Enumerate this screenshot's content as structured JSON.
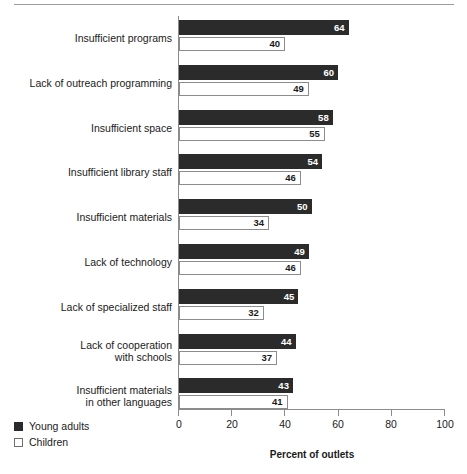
{
  "chart_data": {
    "type": "bar",
    "orientation": "horizontal",
    "title": "",
    "xlabel": "Percent of outlets",
    "ylabel": "",
    "xlim": [
      0,
      100
    ],
    "xticks": [
      0,
      20,
      40,
      60,
      80,
      100
    ],
    "xtick_labels": [
      "0",
      "20",
      "40",
      "60",
      "80",
      "100"
    ],
    "grid": false,
    "legend_position": "bottom-left",
    "categories": [
      "Insufficient programs",
      "Lack of outreach programming",
      "Insufficient space",
      "Insufficient library staff",
      "Insufficient materials",
      "Lack of technology",
      "Lack of specialized staff",
      "Lack of cooperation\nwith schools",
      "Insufficient materials\nin other languages"
    ],
    "series": [
      {
        "name": "Young adults",
        "color": "#2b2b2b",
        "style": "filled",
        "values": [
          64,
          60,
          58,
          54,
          50,
          49,
          45,
          44,
          43
        ]
      },
      {
        "name": "Children",
        "color": "#ffffff",
        "style": "outlined",
        "values": [
          40,
          49,
          55,
          46,
          34,
          46,
          32,
          37,
          41
        ]
      }
    ]
  }
}
